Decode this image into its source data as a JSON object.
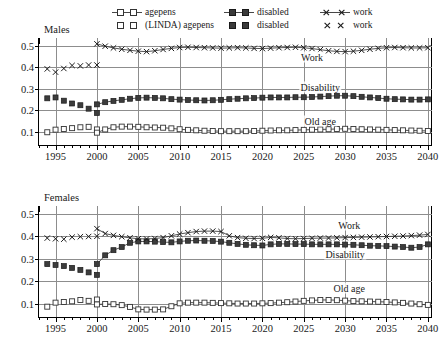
{
  "legend": {
    "rows": [
      {
        "connected": true,
        "entries": [
          {
            "label": "agepens",
            "marker": "open-square",
            "line": true
          },
          {
            "label": "disabled",
            "marker": "filled-square",
            "line": true
          },
          {
            "label": "work",
            "marker": "cross",
            "line": true
          }
        ]
      },
      {
        "connected": false,
        "entries": [
          {
            "label": "(LINDA) agepens",
            "marker": "open-square",
            "line": false
          },
          {
            "label": "disabled",
            "marker": "filled-square",
            "line": false
          },
          {
            "label": "work",
            "marker": "cross",
            "line": false
          }
        ]
      }
    ]
  },
  "panels": [
    {
      "key": "males",
      "title": "Males",
      "annotations": [
        {
          "text": "Work",
          "x": 2026.0,
          "y": 0.449
        },
        {
          "text": "Disability",
          "x": 2027.0,
          "y": 0.31
        },
        {
          "text": "Old age",
          "x": 2027.0,
          "y": 0.15
        }
      ]
    },
    {
      "key": "females",
      "title": "Females",
      "annotations": [
        {
          "text": "Work",
          "x": 2030.5,
          "y": 0.452
        },
        {
          "text": "Disability",
          "x": 2030.0,
          "y": 0.323
        },
        {
          "text": "Old age",
          "x": 2030.5,
          "y": 0.168
        }
      ]
    }
  ],
  "axes": {
    "xlabel": "",
    "ylabel": "",
    "xlim": [
      1993,
      2040.5
    ],
    "ylim": [
      0.04,
      0.535
    ],
    "xticks": [
      1995,
      2000,
      2005,
      2010,
      2015,
      2020,
      2025,
      2030,
      2035,
      2040
    ],
    "xtick_labels": [
      "1995",
      "2000",
      "2005",
      "2010",
      "2015",
      "2020",
      "2025",
      "2030",
      "2035",
      "2040"
    ],
    "xminor_step": 1,
    "yticks": [
      0.1,
      0.2,
      0.3,
      0.4,
      0.5
    ],
    "ytick_labels": [
      "0.1",
      "0.2",
      "0.3",
      "0.4",
      "0.5"
    ],
    "grid": true
  },
  "colors": {
    "ink": "#1a1a1a",
    "axis": "#000000",
    "grid": "#8d8d8d",
    "series": "#333333"
  },
  "chart_data": {
    "type": "line",
    "title": "",
    "xlabel": "",
    "ylabel": "",
    "xlim": [
      1993,
      2040.5
    ],
    "ylim": [
      0.04,
      0.535
    ],
    "grid": true,
    "legend_position": "top",
    "panels": [
      {
        "name": "Males",
        "series": [
          {
            "name": "(LINDA) agepens",
            "source": "LINDA",
            "marker": "open-square",
            "line": false,
            "x": [
              1994,
              1995,
              1996,
              1997,
              1998,
              1999,
              2000
            ],
            "values": [
              0.099,
              0.111,
              0.114,
              0.118,
              0.122,
              0.124,
              0.112
            ]
          },
          {
            "name": "(LINDA) disabled",
            "source": "LINDA",
            "marker": "filled-square",
            "line": false,
            "x": [
              1994,
              1995,
              1996,
              1997,
              1998,
              1999,
              2000
            ],
            "values": [
              0.256,
              0.26,
              0.245,
              0.232,
              0.224,
              0.208,
              0.188
            ]
          },
          {
            "name": "(LINDA) work",
            "source": "LINDA",
            "marker": "cross",
            "line": false,
            "x": [
              1994,
              1995,
              1996,
              1997,
              1998,
              1999,
              2000
            ],
            "values": [
              0.392,
              0.377,
              0.394,
              0.408,
              0.406,
              0.41,
              0.41
            ]
          },
          {
            "name": "agepens",
            "source": "model",
            "marker": "open-square",
            "line": true,
            "x": [
              2000,
              2001,
              2002,
              2003,
              2004,
              2005,
              2006,
              2007,
              2008,
              2009,
              2010,
              2011,
              2012,
              2013,
              2014,
              2015,
              2016,
              2017,
              2018,
              2019,
              2020,
              2021,
              2022,
              2023,
              2024,
              2025,
              2026,
              2027,
              2028,
              2029,
              2030,
              2031,
              2032,
              2033,
              2034,
              2035,
              2036,
              2037,
              2038,
              2039,
              2040
            ],
            "values": [
              0.097,
              0.112,
              0.122,
              0.125,
              0.125,
              0.124,
              0.122,
              0.121,
              0.12,
              0.117,
              0.113,
              0.11,
              0.108,
              0.106,
              0.105,
              0.104,
              0.104,
              0.104,
              0.104,
              0.105,
              0.106,
              0.107,
              0.108,
              0.108,
              0.109,
              0.11,
              0.111,
              0.112,
              0.113,
              0.114,
              0.115,
              0.114,
              0.113,
              0.112,
              0.111,
              0.11,
              0.109,
              0.108,
              0.107,
              0.106,
              0.105
            ]
          },
          {
            "name": "disabled",
            "source": "model",
            "marker": "filled-square",
            "line": true,
            "x": [
              2000,
              2001,
              2002,
              2003,
              2004,
              2005,
              2006,
              2007,
              2008,
              2009,
              2010,
              2011,
              2012,
              2013,
              2014,
              2015,
              2016,
              2017,
              2018,
              2019,
              2020,
              2021,
              2022,
              2023,
              2024,
              2025,
              2026,
              2027,
              2028,
              2029,
              2030,
              2031,
              2032,
              2033,
              2034,
              2035,
              2036,
              2037,
              2038,
              2039,
              2040
            ],
            "values": [
              0.228,
              0.238,
              0.244,
              0.249,
              0.254,
              0.258,
              0.259,
              0.258,
              0.256,
              0.252,
              0.25,
              0.248,
              0.247,
              0.246,
              0.247,
              0.249,
              0.252,
              0.254,
              0.256,
              0.257,
              0.259,
              0.26,
              0.26,
              0.26,
              0.261,
              0.261,
              0.262,
              0.264,
              0.266,
              0.268,
              0.268,
              0.266,
              0.263,
              0.26,
              0.257,
              0.254,
              0.252,
              0.251,
              0.25,
              0.25,
              0.251
            ]
          },
          {
            "name": "work",
            "source": "model",
            "marker": "cross",
            "line": true,
            "x": [
              2000,
              2001,
              2002,
              2003,
              2004,
              2005,
              2006,
              2007,
              2008,
              2009,
              2010,
              2011,
              2012,
              2013,
              2014,
              2015,
              2016,
              2017,
              2018,
              2019,
              2020,
              2021,
              2022,
              2023,
              2024,
              2025,
              2026,
              2027,
              2028,
              2029,
              2030,
              2031,
              2032,
              2033,
              2034,
              2035,
              2036,
              2037,
              2038,
              2039,
              2040
            ],
            "values": [
              0.508,
              0.497,
              0.489,
              0.483,
              0.478,
              0.474,
              0.472,
              0.476,
              0.482,
              0.487,
              0.491,
              0.492,
              0.491,
              0.49,
              0.489,
              0.488,
              0.489,
              0.49,
              0.489,
              0.487,
              0.486,
              0.488,
              0.49,
              0.491,
              0.492,
              0.49,
              0.486,
              0.481,
              0.476,
              0.473,
              0.472,
              0.474,
              0.478,
              0.483,
              0.487,
              0.49,
              0.491,
              0.49,
              0.489,
              0.489,
              0.49
            ]
          }
        ]
      },
      {
        "name": "Females",
        "series": [
          {
            "name": "(LINDA) agepens",
            "source": "LINDA",
            "marker": "open-square",
            "line": false,
            "x": [
              1994,
              1995,
              1996,
              1997,
              1998,
              1999,
              2000
            ],
            "values": [
              0.086,
              0.104,
              0.107,
              0.11,
              0.116,
              0.112,
              0.118
            ]
          },
          {
            "name": "(LINDA) disabled",
            "source": "LINDA",
            "marker": "filled-square",
            "line": false,
            "x": [
              1994,
              1995,
              1996,
              1997,
              1998,
              1999,
              2000
            ],
            "values": [
              0.276,
              0.272,
              0.267,
              0.259,
              0.25,
              0.239,
              0.228
            ]
          },
          {
            "name": "(LINDA) work",
            "source": "LINDA",
            "marker": "cross",
            "line": false,
            "x": [
              1994,
              1995,
              1996,
              1997,
              1998,
              1999,
              2000
            ],
            "values": [
              0.392,
              0.389,
              0.387,
              0.396,
              0.398,
              0.399,
              0.4
            ]
          },
          {
            "name": "agepens",
            "source": "model",
            "marker": "open-square",
            "line": true,
            "x": [
              2000,
              2001,
              2002,
              2003,
              2004,
              2005,
              2006,
              2007,
              2008,
              2009,
              2010,
              2011,
              2012,
              2013,
              2014,
              2015,
              2016,
              2017,
              2018,
              2019,
              2020,
              2021,
              2022,
              2023,
              2024,
              2025,
              2026,
              2027,
              2028,
              2029,
              2030,
              2031,
              2032,
              2033,
              2034,
              2035,
              2036,
              2037,
              2038,
              2039,
              2040
            ],
            "values": [
              0.096,
              0.098,
              0.097,
              0.093,
              0.085,
              0.074,
              0.073,
              0.073,
              0.074,
              0.088,
              0.101,
              0.104,
              0.104,
              0.104,
              0.103,
              0.102,
              0.101,
              0.1,
              0.1,
              0.1,
              0.101,
              0.102,
              0.104,
              0.106,
              0.109,
              0.112,
              0.114,
              0.116,
              0.116,
              0.115,
              0.113,
              0.111,
              0.11,
              0.109,
              0.108,
              0.107,
              0.105,
              0.103,
              0.1,
              0.097,
              0.094
            ]
          },
          {
            "name": "disabled",
            "source": "model",
            "marker": "filled-square",
            "line": true,
            "x": [
              2000,
              2001,
              2002,
              2003,
              2004,
              2005,
              2006,
              2007,
              2008,
              2009,
              2010,
              2011,
              2012,
              2013,
              2014,
              2015,
              2016,
              2017,
              2018,
              2019,
              2020,
              2021,
              2022,
              2023,
              2024,
              2025,
              2026,
              2027,
              2028,
              2029,
              2030,
              2031,
              2032,
              2033,
              2034,
              2035,
              2036,
              2037,
              2038,
              2039,
              2040
            ],
            "values": [
              0.276,
              0.315,
              0.338,
              0.352,
              0.371,
              0.377,
              0.377,
              0.376,
              0.374,
              0.373,
              0.377,
              0.38,
              0.381,
              0.38,
              0.379,
              0.376,
              0.371,
              0.366,
              0.362,
              0.36,
              0.359,
              0.364,
              0.366,
              0.366,
              0.365,
              0.365,
              0.364,
              0.364,
              0.364,
              0.364,
              0.363,
              0.362,
              0.36,
              0.358,
              0.357,
              0.356,
              0.354,
              0.352,
              0.349,
              0.352,
              0.364
            ]
          },
          {
            "name": "work",
            "source": "model",
            "marker": "cross",
            "line": true,
            "x": [
              2000,
              2001,
              2002,
              2003,
              2004,
              2005,
              2006,
              2007,
              2008,
              2009,
              2010,
              2011,
              2012,
              2013,
              2014,
              2015,
              2016,
              2017,
              2018,
              2019,
              2020,
              2021,
              2022,
              2023,
              2024,
              2025,
              2026,
              2027,
              2028,
              2029,
              2030,
              2031,
              2032,
              2033,
              2034,
              2035,
              2036,
              2037,
              2038,
              2039,
              2040
            ],
            "values": [
              0.434,
              0.412,
              0.404,
              0.398,
              0.393,
              0.389,
              0.388,
              0.39,
              0.394,
              0.402,
              0.41,
              0.416,
              0.421,
              0.423,
              0.423,
              0.421,
              0.402,
              0.394,
              0.391,
              0.39,
              0.391,
              0.395,
              0.393,
              0.39,
              0.389,
              0.39,
              0.391,
              0.392,
              0.392,
              0.393,
              0.394,
              0.395,
              0.396,
              0.397,
              0.398,
              0.399,
              0.4,
              0.401,
              0.403,
              0.405,
              0.408
            ]
          }
        ]
      }
    ]
  }
}
